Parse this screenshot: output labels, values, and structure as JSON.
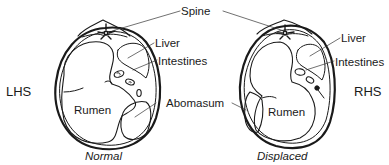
{
  "diagram": {
    "type": "anatomical cross-section comparison",
    "labels": {
      "spine": "Spine",
      "liver_left": "Liver",
      "intestines_left": "Intestines",
      "abomasum": "Abomasum",
      "liver_right": "Liver",
      "intestines_right": "Intestines",
      "rumen_left": "Rumen",
      "rumen_right": "Rumen"
    },
    "sides": {
      "left": "LHS",
      "right": "RHS"
    },
    "captions": {
      "left": "Normal",
      "right": "Displaced"
    },
    "colors": {
      "line": "#1a1a1a",
      "background": "#ffffff"
    }
  }
}
